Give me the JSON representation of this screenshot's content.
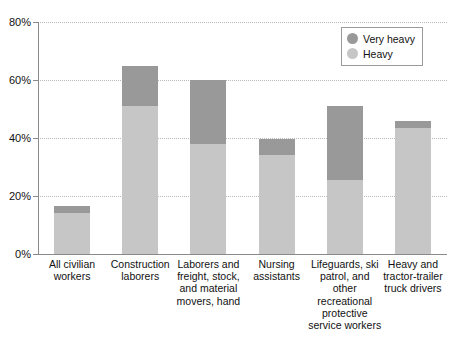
{
  "chart_data": {
    "type": "bar",
    "stacked": true,
    "title": "",
    "xlabel": "",
    "ylabel": "",
    "ylim": [
      0,
      80
    ],
    "ytick_labels": [
      "0%",
      "20%",
      "40%",
      "60%",
      "80%"
    ],
    "ytick_values": [
      0,
      20,
      40,
      60,
      80
    ],
    "grid": true,
    "legend_position": "top-right",
    "categories": [
      "All civilian workers",
      "Construction laborers",
      "Laborers and freight, stock, and material movers, hand",
      "Nursing assistants",
      "Lifeguards, ski patrol, and other recreational protective service workers",
      "Heavy and tractor-trailer truck drivers"
    ],
    "category_lines": [
      [
        "All civilian",
        "workers"
      ],
      [
        "Construction",
        "laborers"
      ],
      [
        "Laborers and",
        "freight, stock,",
        "and material",
        "movers, hand"
      ],
      [
        "Nursing",
        "assistants"
      ],
      [
        "Lifeguards, ski",
        "patrol, and",
        "other",
        "recreational",
        "protective",
        "service workers"
      ],
      [
        "Heavy and",
        "tractor-trailer",
        "truck drivers"
      ]
    ],
    "series": [
      {
        "name": "Heavy",
        "color": "#c6c6c6",
        "values": [
          14,
          51,
          38,
          34,
          25.5,
          43.5
        ]
      },
      {
        "name": "Very heavy",
        "color": "#999999",
        "values": [
          2.5,
          14,
          22,
          5.5,
          25.5,
          2.5
        ]
      }
    ],
    "totals": [
      16.5,
      65,
      60,
      39.5,
      51,
      46
    ]
  },
  "legend": {
    "items": [
      {
        "label": "Very heavy",
        "color": "#999999"
      },
      {
        "label": "Heavy",
        "color": "#c6c6c6"
      }
    ]
  },
  "colors": {
    "very_heavy": "#999999",
    "heavy": "#c6c6c6",
    "axis": "#8a8a8a",
    "grid": "#b9b9b9",
    "background": "#ffffff"
  }
}
